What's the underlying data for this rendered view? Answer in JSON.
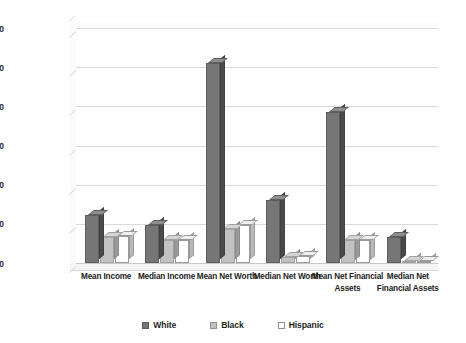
{
  "chart_data": {
    "type": "bar",
    "title": "",
    "subtitle": "",
    "xlabel": "",
    "ylabel": "",
    "ylim": [
      0,
      300000
    ],
    "grid": true,
    "legend_position": "bottom",
    "y_ticks": [
      0,
      50000,
      100000,
      150000,
      200000,
      250000,
      300000
    ],
    "y_tick_labels": [
      "$0",
      "$50,000",
      "$100,000",
      "$150,000",
      "$200,000",
      "$250,000",
      "$300,000"
    ],
    "categories": [
      "Mean Income",
      "Median Income",
      "Mean Net Worth",
      "Median Net Worth",
      "Mean Net Financial Assets",
      "Median Net Financial Assets"
    ],
    "series": [
      {
        "name": "White",
        "color": "#767676",
        "values": [
          61000,
          48000,
          255000,
          80000,
          193000,
          33000
        ]
      },
      {
        "name": "Black",
        "color": "#c2c2c2",
        "values": [
          33000,
          29000,
          44000,
          8000,
          30000,
          3000
        ]
      },
      {
        "name": "Hispanic",
        "color": "#ffffff",
        "values": [
          34000,
          29000,
          49000,
          9000,
          30000,
          2000
        ]
      }
    ]
  },
  "legend": {
    "items": [
      {
        "label": "White"
      },
      {
        "label": "Black"
      },
      {
        "label": "Hispanic"
      }
    ]
  }
}
